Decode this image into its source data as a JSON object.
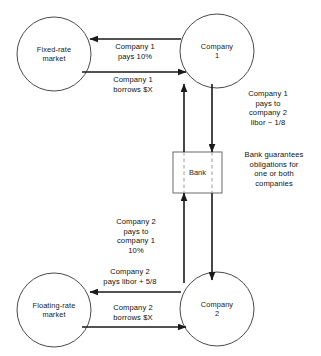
{
  "diagram": {
    "type": "financial-swap-flow-diagram",
    "nodes": [
      {
        "id": "fixed-rate-market",
        "shape": "circle",
        "line1": "Fixed-rate",
        "line2": "market"
      },
      {
        "id": "company-1",
        "shape": "circle",
        "line1": "Company",
        "line2": "1"
      },
      {
        "id": "bank",
        "shape": "rectangle",
        "line1": "Bank",
        "line2": ""
      },
      {
        "id": "floating-rate-market",
        "shape": "circle",
        "line1": "Floating-rate",
        "line2": "market"
      },
      {
        "id": "company-2",
        "shape": "circle",
        "line1": "Company",
        "line2": "2"
      }
    ],
    "edge_labels": {
      "company1_pays_fixed": "Company 1\npays 10%",
      "company1_borrows": "Company 1\nborrows $X",
      "company1_pays_to_company2": "Company 1\npays to\ncompany 2\nlibor − 1/8",
      "bank_guarantee": "Bank guarantees\nobligations for\none or both\ncompanies",
      "company2_pays_to_company1": "Company 2\npays to\ncompany 1\n10%",
      "company2_pays_floating": "Company 2\npays libor + 5/8",
      "company2_borrows": "Company 2\nborrows $X"
    },
    "edge_label_lines": {
      "company1_pays_fixed": [
        "Company 1",
        "pays 10%"
      ],
      "company1_borrows": [
        "Company 1",
        "borrows $X"
      ],
      "company1_pays_to_company2": [
        "Company 1",
        "pays to",
        "company 2",
        "libor − 1/8"
      ],
      "bank_guarantee": [
        "Bank guarantees",
        "obligations for",
        "one or both",
        "companies"
      ],
      "company2_pays_to_company1": [
        "Company 2",
        "pays to",
        "company 1",
        "10%"
      ],
      "company2_pays_floating": [
        "Company 2",
        "pays libor + 5/8"
      ],
      "company2_borrows": [
        "Company 2",
        "borrows $X"
      ]
    },
    "colors": {
      "stroke": "#1a1a1a",
      "node_stroke": "#4a4a4a",
      "bank_stroke": "#6a6a6a",
      "dashed_stroke": "#9a9a9a",
      "text": "#111111",
      "background": "#ffffff"
    }
  }
}
